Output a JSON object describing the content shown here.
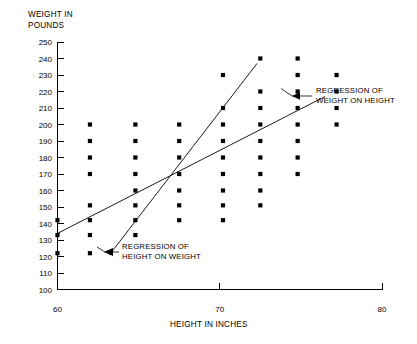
{
  "chart_data": {
    "type": "scatter",
    "title": "",
    "xlabel": "HEIGHT IN INCHES",
    "ylabel": "WEIGHT IN POUNDS",
    "xlim": [
      60,
      80
    ],
    "ylim": [
      100,
      250
    ],
    "xticks": [
      60,
      70,
      80
    ],
    "xtick_labels": [
      "60",
      "70",
      "80"
    ],
    "yticks": [
      100,
      110,
      120,
      130,
      140,
      150,
      160,
      170,
      180,
      190,
      200,
      210,
      220,
      230,
      240,
      250
    ],
    "ytick_labels": [
      "100",
      "110",
      "120",
      "130",
      "140",
      "150",
      "160",
      "170",
      "180",
      "190",
      "200",
      "210",
      "220",
      "230",
      "240",
      "250"
    ],
    "grid": false,
    "legend": "none",
    "marker": "filled-square",
    "marker_color": "#000000",
    "points": [
      [
        60,
        142
      ],
      [
        60,
        133
      ],
      [
        60,
        122
      ],
      [
        62,
        200
      ],
      [
        62,
        190
      ],
      [
        62,
        180
      ],
      [
        62,
        170
      ],
      [
        62,
        151
      ],
      [
        62,
        142
      ],
      [
        62,
        133
      ],
      [
        62,
        122
      ],
      [
        64.8,
        200
      ],
      [
        64.8,
        190
      ],
      [
        64.8,
        180
      ],
      [
        64.8,
        170
      ],
      [
        64.8,
        160
      ],
      [
        64.8,
        151
      ],
      [
        64.8,
        142
      ],
      [
        64.8,
        133
      ],
      [
        67.5,
        200
      ],
      [
        67.5,
        190
      ],
      [
        67.5,
        180
      ],
      [
        67.5,
        170
      ],
      [
        67.5,
        160
      ],
      [
        67.5,
        151
      ],
      [
        67.5,
        142
      ],
      [
        70.2,
        230
      ],
      [
        70.2,
        210
      ],
      [
        70.2,
        200
      ],
      [
        70.2,
        190
      ],
      [
        70.2,
        180
      ],
      [
        70.2,
        170
      ],
      [
        70.2,
        160
      ],
      [
        70.2,
        151
      ],
      [
        70.2,
        142
      ],
      [
        72.5,
        240
      ],
      [
        72.5,
        220
      ],
      [
        72.5,
        210
      ],
      [
        72.5,
        200
      ],
      [
        72.5,
        190
      ],
      [
        72.5,
        180
      ],
      [
        72.5,
        170
      ],
      [
        72.5,
        160
      ],
      [
        72.5,
        151
      ],
      [
        74.8,
        240
      ],
      [
        74.8,
        230
      ],
      [
        74.8,
        220
      ],
      [
        74.8,
        210
      ],
      [
        74.8,
        200
      ],
      [
        74.8,
        190
      ],
      [
        74.8,
        180
      ],
      [
        74.8,
        170
      ],
      [
        77.2,
        230
      ],
      [
        77.2,
        220
      ],
      [
        77.2,
        210
      ],
      [
        77.2,
        200
      ]
    ],
    "lines": [
      {
        "name": "regression-of-weight-on-height",
        "label": "REGRESSION OF WEIGHT ON HEIGHT",
        "x0": 60.0,
        "y0": 134.0,
        "x1": 76.5,
        "y1": 217.0
      },
      {
        "name": "regression-of-height-on-weight",
        "label": "REGRESSION OF HEIGHT ON WEIGHT",
        "x0": 63.2,
        "y0": 121.0,
        "x1": 72.3,
        "y1": 237.0
      }
    ],
    "annotations": [
      {
        "name": "weight-on-height-annotation",
        "line1": "REGRESSION OF",
        "line2": "WEIGHT ON HEIGHT",
        "text_x": 314,
        "text_y": 96
      },
      {
        "name": "height-on-weight-annotation",
        "line1": "REGRESSION OF",
        "line2": "HEIGHT ON WEIGHT",
        "text_x": 122,
        "text_y": 252
      }
    ]
  },
  "axis": {
    "y_title_line1": "WEIGHT IN",
    "y_title_line2": "POUNDS",
    "x_title": "HEIGHT IN INCHES"
  }
}
